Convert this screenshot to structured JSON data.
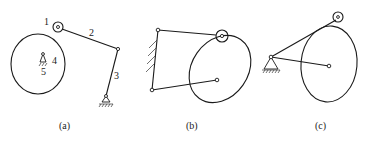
{
  "figures": [
    {
      "caption": "(a)",
      "labels": [
        "1",
        "2",
        "3",
        "4",
        "5"
      ]
    },
    {
      "caption": "(b)",
      "labels": []
    },
    {
      "caption": "(c)",
      "labels": []
    }
  ]
}
